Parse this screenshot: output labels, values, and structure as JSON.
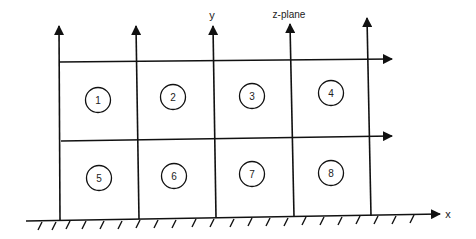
{
  "diagram": {
    "plane_label": "z-plane",
    "y_axis_label": "y",
    "x_axis_label": "x",
    "cells": [
      {
        "id": "1",
        "label": "1"
      },
      {
        "id": "2",
        "label": "2"
      },
      {
        "id": "3",
        "label": "3"
      },
      {
        "id": "4",
        "label": "4"
      },
      {
        "id": "5",
        "label": "5"
      },
      {
        "id": "6",
        "label": "6"
      },
      {
        "id": "7",
        "label": "7"
      },
      {
        "id": "8",
        "label": "8"
      }
    ]
  }
}
